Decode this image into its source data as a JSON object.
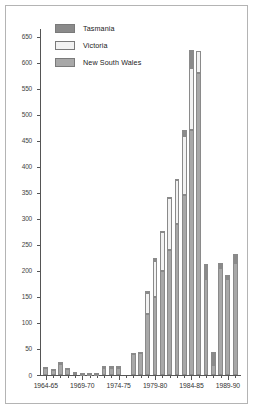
{
  "chart_data": {
    "type": "bar",
    "stacked": true,
    "title": "",
    "subtitle": "",
    "xlabel": "",
    "ylabel": "",
    "ylim": [
      0,
      665
    ],
    "ytick_values": [
      0,
      50,
      100,
      150,
      200,
      250,
      300,
      350,
      400,
      450,
      500,
      550,
      600,
      650
    ],
    "ytick_labels": [
      "0",
      "50",
      "100",
      "150",
      "200",
      "250",
      "300",
      "350",
      "400",
      "450",
      "500",
      "550",
      "600",
      "650"
    ],
    "grid": false,
    "legend_position": "upper-left",
    "categories": [
      "1964-65",
      "1965-66",
      "1966-67",
      "1967-68",
      "1968-69",
      "1969-70",
      "1970-71",
      "1971-72",
      "1972-73",
      "1973-74",
      "1974-75",
      "1975-76",
      "1976-77",
      "1977-78",
      "1978-79",
      "1979-80",
      "1980-81",
      "1981-82",
      "1982-83",
      "1983-84",
      "1984-85",
      "1985-86",
      "1986-87",
      "1987-88",
      "1988-89",
      "1989-90",
      "1990-91"
    ],
    "xtick_labels": [
      "1964-65",
      "1969-70",
      "1974-75",
      "1979-80",
      "1984-85",
      "1989-90"
    ],
    "xtick_indices": [
      0,
      5,
      10,
      15,
      20,
      25
    ],
    "series": [
      {
        "name": "New South Wales",
        "color": "#a8a8a8",
        "values": [
          14,
          10,
          22,
          12,
          5,
          2,
          2,
          2,
          14,
          14,
          14,
          0,
          40,
          42,
          118,
          150,
          200,
          240,
          290,
          345,
          470,
          580,
          185,
          20,
          205,
          185,
          215
        ]
      },
      {
        "name": "Victoria",
        "color": "#f2f2f2",
        "values": [
          2,
          2,
          3,
          2,
          1,
          1,
          1,
          1,
          2,
          2,
          2,
          0,
          2,
          3,
          40,
          70,
          75,
          100,
          85,
          115,
          120,
          42,
          0,
          0,
          0,
          0,
          0
        ]
      },
      {
        "name": "Tasmania",
        "color": "#8a8a8a",
        "values": [
          0,
          0,
          0,
          0,
          0,
          0,
          0,
          0,
          2,
          2,
          2,
          0,
          0,
          0,
          3,
          5,
          2,
          3,
          2,
          10,
          35,
          0,
          28,
          25,
          10,
          8,
          18
        ]
      }
    ]
  },
  "legend": {
    "items": [
      {
        "label": "Tasmania",
        "color": "#8a8a8a"
      },
      {
        "label": "Victoria",
        "color": "#f2f2f2"
      },
      {
        "label": "New South Wales",
        "color": "#a8a8a8"
      }
    ]
  }
}
